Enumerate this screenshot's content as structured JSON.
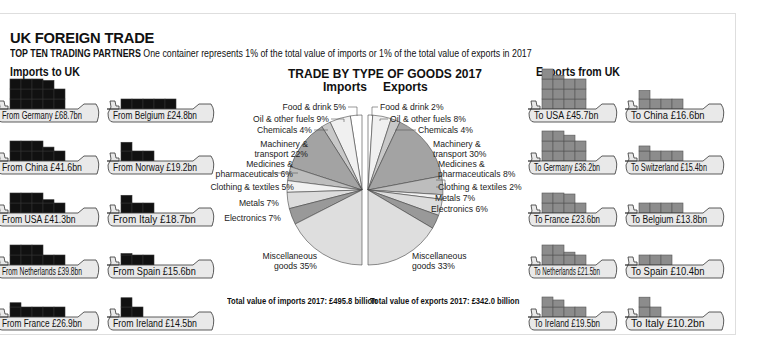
{
  "header": {
    "title": "UK FOREIGN TRADE",
    "subtitle_bold": "TOP TEN TRADING PARTNERS",
    "subtitle_rest": " One container represents 1% of the total value of imports or 1% of the total value of exports in 2017"
  },
  "imports": {
    "heading": "Imports to UK",
    "container_color": "#111111",
    "partners": [
      {
        "label": "From Germany £68.7bn",
        "country": "Germany",
        "value_bn": 68.7
      },
      {
        "label": "From Belgium £24.8bn",
        "country": "Belgium",
        "value_bn": 24.8
      },
      {
        "label": "From China £41.6bn",
        "country": "China",
        "value_bn": 41.6
      },
      {
        "label": "From Norway £19.2bn",
        "country": "Norway",
        "value_bn": 19.2
      },
      {
        "label": "From USA £41.3bn",
        "country": "USA",
        "value_bn": 41.3
      },
      {
        "label": "From Italy £18.7bn",
        "country": "Italy",
        "value_bn": 18.7
      },
      {
        "label": "From Netherlands £39.8bn",
        "country": "Netherlands",
        "value_bn": 39.8
      },
      {
        "label": "From Spain £15.6bn",
        "country": "Spain",
        "value_bn": 15.6
      },
      {
        "label": "From France £26.9bn",
        "country": "France",
        "value_bn": 26.9
      },
      {
        "label": "From Ireland £14.5bn",
        "country": "Ireland",
        "value_bn": 14.5
      }
    ],
    "total_label": "Total value of imports 2017: £495.8 billion"
  },
  "exports": {
    "heading": "Exports from UK",
    "container_color": "#8c8c8c",
    "partners": [
      {
        "label": "To USA £45.7bn",
        "country": "USA",
        "value_bn": 45.7
      },
      {
        "label": "To China £16.6bn",
        "country": "China",
        "value_bn": 16.6
      },
      {
        "label": "To Germany £36.2bn",
        "country": "Germany",
        "value_bn": 36.2
      },
      {
        "label": "To Switzerland £15.4bn",
        "country": "Switzerland",
        "value_bn": 15.4
      },
      {
        "label": "To France £23.6bn",
        "country": "France",
        "value_bn": 23.6
      },
      {
        "label": "To Belgium £13.8bn",
        "country": "Belgium",
        "value_bn": 13.8
      },
      {
        "label": "To Netherlands £21.5bn",
        "country": "Netherlands",
        "value_bn": 21.5
      },
      {
        "label": "To Spain £10.4bn",
        "country": "Spain",
        "value_bn": 10.4
      },
      {
        "label": "To Ireland £19.5bn",
        "country": "Ireland",
        "value_bn": 19.5
      },
      {
        "label": "To Italy £10.2bn",
        "country": "Italy",
        "value_bn": 10.2
      }
    ],
    "total_label": "Total value of exports 2017: £342.0 billion"
  },
  "chart_data": [
    {
      "type": "pie",
      "title": "TRADE BY TYPE OF GOODS 2017",
      "subtitle": "Imports",
      "categories": [
        "Food & drink",
        "Oil & other fuels",
        "Chemicals",
        "Machinery & transport",
        "Medicines & pharmaceuticals",
        "Clothing & textiles",
        "Metals",
        "Electronics",
        "Miscellaneous goods"
      ],
      "values": [
        5,
        9,
        4,
        22,
        6,
        5,
        7,
        7,
        35
      ],
      "labels": [
        "Food & drink 5%",
        "Oil & other fuels 9%",
        "Chemicals 4%",
        "Machinery &|transport 22%",
        "Medicines &|pharmaceuticals 6%",
        "Clothing & textiles 5%",
        "Metals 7%",
        "Electronics 7%",
        "Miscellaneous|goods 35%"
      ],
      "colors": [
        "#ffffff",
        "#f0f0f0",
        "#c8c8c8",
        "#a3a3a3",
        "#bdbdbd",
        "#f2f2f2",
        "#dcdcdc",
        "#999999",
        "#dedede"
      ],
      "unit": "%",
      "layout": "left half-circle"
    },
    {
      "type": "pie",
      "title": "TRADE BY TYPE OF GOODS 2017",
      "subtitle": "Exports",
      "categories": [
        "Food & drink",
        "Oil & other fuels",
        "Chemicals",
        "Machinery & transport",
        "Medicines & pharmaceuticals",
        "Clothing & textiles",
        "Metals",
        "Electronics",
        "Miscellaneous goods"
      ],
      "values": [
        2,
        8,
        4,
        30,
        8,
        2,
        7,
        6,
        33
      ],
      "labels": [
        "Food & drink 2%",
        "Oil & other fuels 8%",
        "Chemicals 4%",
        "Machinery &|transport 30%",
        "Medicines &|pharmaceuticals 8%",
        "Clothing & textiles 2%",
        "Metals 7%",
        "Electronics 6%",
        "Miscellaneous|goods 33%"
      ],
      "colors": [
        "#ffffff",
        "#f0f0f0",
        "#c8c8c8",
        "#a3a3a3",
        "#bdbdbd",
        "#f2f2f2",
        "#dcdcdc",
        "#999999",
        "#dedede"
      ],
      "unit": "%",
      "layout": "right half-circle"
    }
  ],
  "pie_headers": {
    "imports": "Imports",
    "exports": "Exports"
  }
}
